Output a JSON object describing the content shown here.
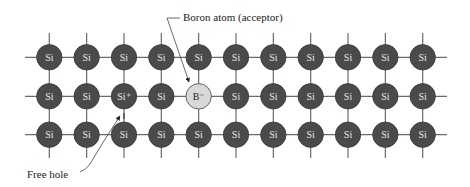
{
  "diagram": {
    "columns": 11,
    "rows": 3,
    "atoms": [
      [
        "Si",
        "Si",
        "Si",
        "Si",
        "Si",
        "Si",
        "Si",
        "Si",
        "Si",
        "Si",
        "Si"
      ],
      [
        "Si",
        "Si",
        "Si⁺",
        "Si",
        "B⁻",
        "Si",
        "Si",
        "Si",
        "Si",
        "Si",
        "Si"
      ],
      [
        "Si",
        "Si",
        "Si",
        "Si",
        "Si",
        "Si",
        "Si",
        "Si",
        "Si",
        "Si",
        "Si"
      ]
    ],
    "dopant": {
      "row": 1,
      "col": 4,
      "label": "B⁻"
    },
    "ionized_si": {
      "row": 1,
      "col": 2,
      "label": "Si⁺"
    },
    "annotations": {
      "boron": "Boron atom (acceptor)",
      "hole": "Free hole"
    },
    "colors": {
      "silicon": "#4a4a4a",
      "boron": "#d8d8d8",
      "bond": "#6a6a6a"
    }
  }
}
